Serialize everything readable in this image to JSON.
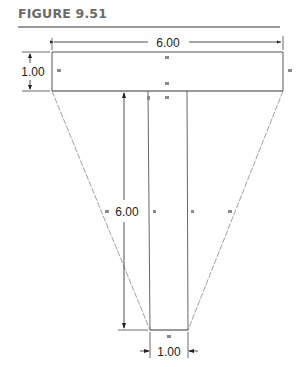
{
  "figure": {
    "title": "FIGURE 9.51"
  },
  "dimensions": {
    "top_width": "6.00",
    "top_height": "1.00",
    "web_height": "6.00",
    "bottom_width": "1.00"
  },
  "colors": {
    "outline": "#222222",
    "construction": "#888888",
    "marker": "#8a8a8a",
    "title": "#6b6b6b"
  }
}
